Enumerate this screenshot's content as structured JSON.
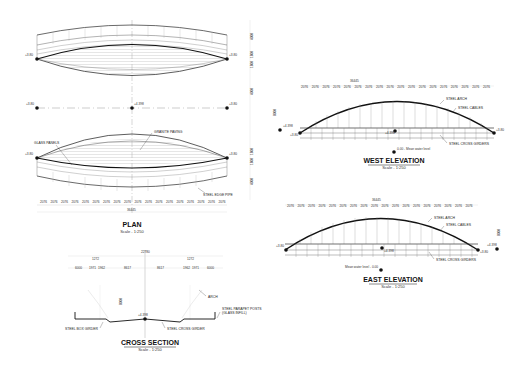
{
  "drawings": {
    "plan": {
      "title": "PLAN",
      "scale": "Scale - 1:250",
      "levels": {
        "left": "+3.80",
        "right": "+3.80",
        "center_axis": "+4.398",
        "axis_left": "+3.80",
        "axis_right": "+3.80",
        "lower_left": "+3.80",
        "lower_right": "+3.80"
      },
      "labels": {
        "glass_panels": "GLASS PANELS",
        "granite_paving": "GRANITE PAVING",
        "steel_edge_pipe": "STEEL EDGE PIPE"
      },
      "bay_dims": [
        "2076",
        "2076",
        "2076",
        "2076",
        "2076",
        "2076",
        "2076",
        "2076",
        "2076",
        "2076",
        "2076",
        "2076",
        "2076",
        "2076",
        "2076",
        "2076",
        "2076",
        "2076"
      ],
      "overall_dim": "36445",
      "side_dims": [
        "4000",
        "1800",
        "1800",
        "4000",
        "1800",
        "1800",
        "4000"
      ]
    },
    "west_elevation": {
      "title": "WEST ELEVATION",
      "scale": "Scale - 1:250",
      "overall_dim": "36445",
      "bay_dims": [
        "2076",
        "2076",
        "2076",
        "2076",
        "2076",
        "2076",
        "2076",
        "2076",
        "2076",
        "2076",
        "2076",
        "2076",
        "2076",
        "2076",
        "2076",
        "2076",
        "2076",
        "2076"
      ],
      "height_dim": "8000",
      "levels": {
        "left_top": "+4.398",
        "left": "+3.80",
        "right": "+3.80",
        "center": "+4.398",
        "water": "0.00 - Mean water level"
      },
      "labels": {
        "arch": "STEEL ARCH",
        "cables": "STEEL CABLES",
        "girders": "STEEL CROSS GIRDERS"
      }
    },
    "east_elevation": {
      "title": "EAST ELEVATION",
      "scale": "Scale - 1:250",
      "overall_dim": "36445",
      "bay_dims": [
        "2076",
        "2076",
        "2076",
        "2076",
        "2076",
        "2076",
        "2076",
        "2076",
        "2076",
        "2076",
        "2076",
        "2076",
        "2076",
        "2076",
        "2076",
        "2076",
        "2076",
        "2076"
      ],
      "height_dim": "8000",
      "levels": {
        "left": "+3.80",
        "right": "+3.80",
        "right_top": "+4.398",
        "center": "+4.398",
        "water": "Mean water level - 0.00"
      },
      "labels": {
        "arch": "STEEL ARCH",
        "cables": "STEEL CABLES",
        "girders": "STEEL CROSS GIRDERS"
      }
    },
    "cross_section": {
      "title": "CROSS SECTION",
      "scale": "Scale - 1:250",
      "overall_dim": "22780",
      "top_dims": [
        "1272",
        "1272"
      ],
      "dims": [
        "6000",
        "1971",
        "1962",
        "8617",
        "8617",
        "1962",
        "1971",
        "6000"
      ],
      "height_dim": "8000",
      "level": "+4.398",
      "labels": {
        "arch": "ARCH",
        "box_girder": "STEEL BOX GIRDER",
        "cross_girder": "STEEL CROSS GIRDER",
        "parapet": "STEEL PARAPET POSTS",
        "parapet2": "(GLASS INFILL)"
      }
    }
  }
}
